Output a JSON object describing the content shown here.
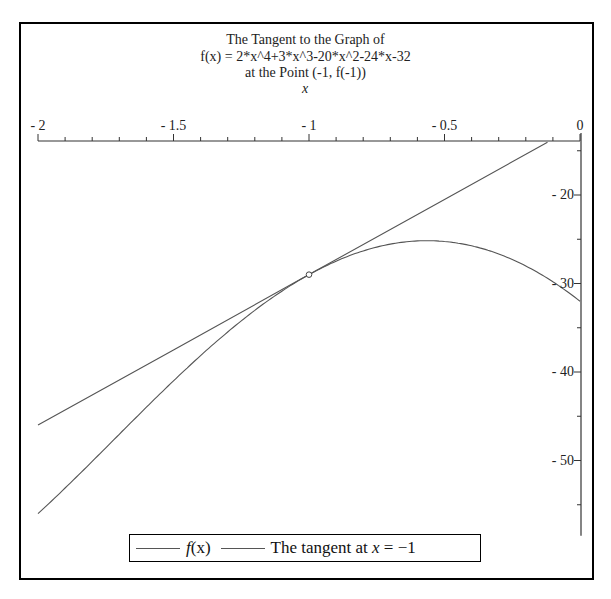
{
  "chart_data": {
    "type": "line",
    "title": "The Tangent to the Graph of",
    "title_lines": [
      "The Tangent to the Graph of",
      "f(x) = 2*x^4+3*x^3-20*x^2-24*x-32",
      "at the Point (-1, f(-1))"
    ],
    "xlabel": "x",
    "ylabel": "",
    "xlim": [
      -2,
      0
    ],
    "ylim": [
      -58.5,
      -13.9
    ],
    "x_ticks": [
      {
        "value": -2,
        "label": "-2"
      },
      {
        "value": -1.5,
        "label": "-1.5"
      },
      {
        "value": -1,
        "label": "-1"
      },
      {
        "value": -0.5,
        "label": "-0.5"
      },
      {
        "value": 0,
        "label": "0"
      }
    ],
    "y_ticks": [
      {
        "value": -20,
        "label": "-20"
      },
      {
        "value": -30,
        "label": "-30"
      },
      {
        "value": -40,
        "label": "-40"
      },
      {
        "value": -50,
        "label": "-50"
      }
    ],
    "grid": false,
    "legend_position": "bottom",
    "series": [
      {
        "name": "f(x)",
        "expression": "2*x^4+3*x^3-20*x^2-24*x-32",
        "x": [
          -2,
          -1.8,
          -1.6,
          -1.4,
          -1.2,
          -1,
          -0.8,
          -0.6,
          -0.4,
          -0.2,
          0
        ],
        "values": [
          -56,
          -48.63,
          -41.26,
          -34.64,
          -30.28,
          -29,
          -27.03,
          -25.48,
          -25.46,
          -28.26,
          -32
        ],
        "color": "#555555"
      },
      {
        "name": "The tangent at x = -1",
        "expression": "-29+17*(x+1)",
        "x": [
          -2,
          -1.5,
          -1,
          -0.5,
          -0.12
        ],
        "values": [
          -46,
          -37.5,
          -29,
          -20.5,
          -14.04
        ],
        "color": "#555555"
      }
    ],
    "annotations": [
      {
        "type": "point",
        "x": -1,
        "y": -29,
        "marker": "circle"
      }
    ]
  },
  "legend": {
    "items": [
      {
        "label_fn": "f",
        "label_arg": "(x)"
      },
      {
        "label_prefix": "The tangent at ",
        "label_var": "x",
        "label_suffix": " = −1"
      }
    ]
  }
}
